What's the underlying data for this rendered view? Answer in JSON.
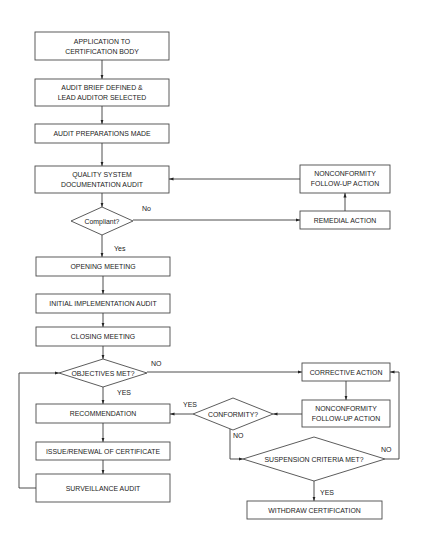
{
  "diagram": {
    "nodes": {
      "application": {
        "lines": [
          "APPLICATION TO",
          "CERTIFICATION BODY"
        ]
      },
      "audit_brief": {
        "lines": [
          "AUDIT BRIEF DEFINED &",
          "LEAD AUDITOR SELECTED"
        ]
      },
      "audit_preparations": {
        "lines": [
          "AUDIT PREPARATIONS MADE"
        ]
      },
      "qs_documentation_audit": {
        "lines": [
          "QUALITY SYSTEM",
          "DOCUMENTATION AUDIT"
        ]
      },
      "compliant": {
        "lines": [
          "Compliant?"
        ]
      },
      "nc_followup_1": {
        "lines": [
          "NONCONFORMITY",
          "FOLLOW-UP ACTION"
        ]
      },
      "remedial_action": {
        "lines": [
          "REMEDIAL  ACTION"
        ]
      },
      "opening_meeting": {
        "lines": [
          "OPENING MEETING"
        ]
      },
      "initial_implementation_audit": {
        "lines": [
          "INITIAL IMPLEMENTATION AUDIT"
        ]
      },
      "closing_meeting": {
        "lines": [
          "CLOSING MEETING"
        ]
      },
      "objectives_met": {
        "lines": [
          "OBJECTIVES MET?"
        ]
      },
      "recommendation": {
        "lines": [
          "RECOMMENDATION"
        ]
      },
      "issue_renewal": {
        "lines": [
          "ISSUE/RENEWAL OF CERTIFICATE"
        ]
      },
      "surveillance_audit": {
        "lines": [
          "SURVEILLANCE AUDIT"
        ]
      },
      "corrective_action": {
        "lines": [
          "CORRECTIVE ACTION"
        ]
      },
      "nc_followup_2": {
        "lines": [
          "NONCONFORMITY",
          "FOLLOW-UP ACTION"
        ]
      },
      "conformity": {
        "lines": [
          "CONFORMITY?"
        ]
      },
      "suspension_criteria": {
        "lines": [
          "SUSPENSION CRITERIA MET?"
        ]
      },
      "withdraw_certification": {
        "lines": [
          "WITHDRAW CERTIFICATION"
        ]
      }
    },
    "edge_labels": {
      "compliant_no": "No",
      "compliant_yes": "Yes",
      "objectives_no": "NO",
      "objectives_yes": "YES",
      "conformity_yes": "YES",
      "conformity_no": "NO",
      "suspension_no": "NO",
      "suspension_yes": "YES"
    },
    "colors": {
      "stroke": "#4a4a4a",
      "text": "#222222",
      "background": "#ffffff"
    }
  }
}
